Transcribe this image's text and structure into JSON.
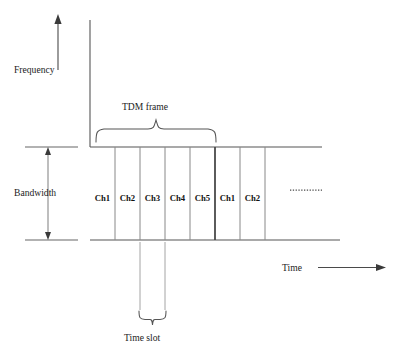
{
  "diagram": {
    "axes": {
      "y_label": "Frequency",
      "x_label": "Time"
    },
    "annotations": {
      "bandwidth_label": "Bandwidth",
      "frame_label": "TDM frame",
      "time_slot_label": "Time slot",
      "continuation_marker": "............."
    },
    "channels": [
      {
        "label": "Ch1",
        "frame": 1
      },
      {
        "label": "Ch2",
        "frame": 1
      },
      {
        "label": "Ch3",
        "frame": 1
      },
      {
        "label": "Ch4",
        "frame": 1
      },
      {
        "label": "Ch5",
        "frame": 1
      },
      {
        "label": "Ch1",
        "frame": 2
      },
      {
        "label": "Ch2",
        "frame": 2
      }
    ],
    "colors": {
      "stroke": "#555555",
      "divider": "#888888",
      "divider_strong": "#4a4a4a",
      "text": "#1c1c1c",
      "background": "#ffffff"
    }
  }
}
